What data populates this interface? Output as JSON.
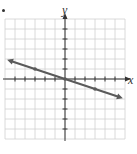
{
  "marker": "•",
  "chart_data": {
    "type": "line",
    "title": "",
    "xlabel": "x",
    "ylabel": "y",
    "xlim": [
      -6,
      6
    ],
    "ylim": [
      -6,
      6
    ],
    "grid": true,
    "legend": null,
    "series": [
      {
        "name": "line",
        "equation": "y = -x/3",
        "x": [
          -5.5,
          -3,
          0,
          3,
          5.5
        ],
        "y": [
          1.83,
          1,
          0,
          -1,
          -1.83
        ],
        "marked_points": [
          [
            -3,
            1
          ],
          [
            0,
            0
          ],
          [
            3,
            -1
          ]
        ],
        "arrows_both_ends": true,
        "color": "#555555"
      }
    ]
  },
  "colors": {
    "grid": "#d0d0d0",
    "axis": "#333333",
    "line": "#5a5a5a"
  }
}
